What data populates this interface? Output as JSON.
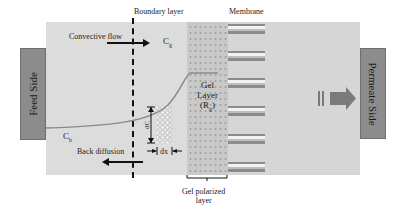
{
  "labels": {
    "boundary_layer": "Boundary layer",
    "membrane": "Membrane",
    "convective_flow": "Convective flow",
    "cg": "C",
    "cg_sub": "g",
    "cb": "C",
    "cb_sub": "b",
    "back_diffusion": "Back diffusion",
    "dc": "dC",
    "dx": "dx",
    "gel_layer_line1": "Gel",
    "gel_layer_line2": "Layer",
    "gel_layer_line3": "(R",
    "gel_layer_sub": "g",
    "gel_layer_close": ")",
    "gel_polarized_line1": "Gel polarized",
    "gel_polarized_line2": "layer"
  },
  "sides": {
    "feed": "Feed Side",
    "permeate": "Permeate Side"
  },
  "colors": {
    "panel": "#d6d6d6",
    "side_box": "#8c8c8c",
    "arrow": "#7a7a7a",
    "curve": "#8a8a8a"
  }
}
